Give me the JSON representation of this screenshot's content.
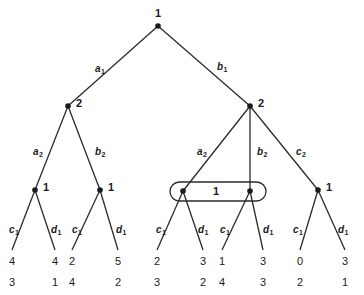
{
  "figure": {
    "background_color": "#ffffff",
    "stroke_color": "#2b2b2b",
    "node_color": "#1a1a1a"
  },
  "nodes": [
    {
      "id": "root",
      "label": "1",
      "x": 158,
      "y": 26,
      "label_dx": 0,
      "label_dy": -13,
      "label_align": "center"
    },
    {
      "id": "n-l2a",
      "label": "2",
      "x": 68,
      "y": 106,
      "label_dx": 8,
      "label_dy": -3,
      "label_align": "left"
    },
    {
      "id": "n-l2b",
      "label": "2",
      "x": 250,
      "y": 106,
      "label_dx": 8,
      "label_dy": -3,
      "label_align": "left"
    },
    {
      "id": "n-l3a",
      "label": "1",
      "x": 35,
      "y": 190,
      "label_dx": 8,
      "label_dy": -3,
      "label_align": "left"
    },
    {
      "id": "n-l3b",
      "label": "1",
      "x": 100,
      "y": 190,
      "label_dx": 8,
      "label_dy": -3,
      "label_align": "left"
    },
    {
      "id": "n-l3c",
      "label": "",
      "x": 183,
      "y": 191,
      "label_dx": 0,
      "label_dy": 0,
      "label_align": "none"
    },
    {
      "id": "n-l3d",
      "label": "",
      "x": 250,
      "y": 191,
      "label_dx": 0,
      "label_dy": 0,
      "label_align": "none"
    },
    {
      "id": "n-l3e",
      "label": "1",
      "x": 318,
      "y": 190,
      "label_dx": 8,
      "label_dy": -3,
      "label_align": "left"
    }
  ],
  "infoset": {
    "id": "infoset-oval",
    "label": "1",
    "label_x": 216,
    "label_y": 192,
    "x": 170,
    "y": 182,
    "width": 96,
    "height": 19
  },
  "edges": [
    {
      "id": "e-root-l",
      "from": "root",
      "to": "n-l2a",
      "label": "a",
      "sub": "1",
      "label_x": 95,
      "label_y": 64
    },
    {
      "id": "e-root-r",
      "from": "root",
      "to": "n-l2b",
      "label": "b",
      "sub": "1",
      "label_x": 217,
      "label_y": 62
    },
    {
      "id": "e-l2a-l",
      "from": "n-l2a",
      "to": "n-l3a",
      "label": "a",
      "sub": "2",
      "label_x": 33,
      "label_y": 147
    },
    {
      "id": "e-l2a-r",
      "from": "n-l2a",
      "to": "n-l3b",
      "label": "b",
      "sub": "2",
      "label_x": 95,
      "label_y": 147
    },
    {
      "id": "e-l2b-a",
      "from": "n-l2b",
      "to": "n-l3c",
      "label": "a",
      "sub": "2",
      "label_x": 197,
      "label_y": 147
    },
    {
      "id": "e-l2b-b",
      "from": "n-l2b",
      "to": "n-l3d",
      "label": "b",
      "sub": "2",
      "label_x": 257,
      "label_y": 147
    },
    {
      "id": "e-l2b-c",
      "from": "n-l2b",
      "to": "n-l3e",
      "label": "c",
      "sub": "2",
      "label_x": 296,
      "label_y": 147
    },
    {
      "id": "e-l3a-c",
      "from": "n-l3a",
      "to": "leaf0",
      "label": "c",
      "sub": "1",
      "label_x": 9,
      "label_y": 225
    },
    {
      "id": "e-l3a-d",
      "from": "n-l3a",
      "to": "leaf1",
      "label": "d",
      "sub": "1",
      "label_x": 51,
      "label_y": 225
    },
    {
      "id": "e-l3b-c",
      "from": "n-l3b",
      "to": "leaf2",
      "label": "c",
      "sub": "1",
      "label_x": 72,
      "label_y": 225
    },
    {
      "id": "e-l3b-d",
      "from": "n-l3b",
      "to": "leaf3",
      "label": "d",
      "sub": "1",
      "label_x": 116,
      "label_y": 225
    },
    {
      "id": "e-l3c-c",
      "from": "n-l3c",
      "to": "leaf4",
      "label": "c",
      "sub": "1",
      "label_x": 156,
      "label_y": 225
    },
    {
      "id": "e-l3c-d",
      "from": "n-l3c",
      "to": "leaf5",
      "label": "d",
      "sub": "1",
      "label_x": 198,
      "label_y": 225
    },
    {
      "id": "e-l3d-c",
      "from": "n-l3d",
      "to": "leaf6",
      "label": "c",
      "sub": "1",
      "label_x": 220,
      "label_y": 225
    },
    {
      "id": "e-l3d-d",
      "from": "n-l3d",
      "to": "leaf7",
      "label": "d",
      "sub": "1",
      "label_x": 263,
      "label_y": 225
    },
    {
      "id": "e-l3e-c",
      "from": "n-l3e",
      "to": "leaf8",
      "label": "c",
      "sub": "1",
      "label_x": 293,
      "label_y": 225
    },
    {
      "id": "e-l3e-d",
      "from": "n-l3e",
      "to": "leaf9",
      "label": "d",
      "sub": "1",
      "label_x": 338,
      "label_y": 225
    }
  ],
  "leaves": [
    {
      "id": "leaf0",
      "x": 12,
      "y": 256,
      "top": "4",
      "bottom": "3"
    },
    {
      "id": "leaf1",
      "x": 55,
      "y": 256,
      "top": "4",
      "bottom": "1"
    },
    {
      "id": "leaf2",
      "x": 72,
      "y": 256,
      "top": "2",
      "bottom": "4"
    },
    {
      "id": "leaf3",
      "x": 118,
      "y": 256,
      "top": "5",
      "bottom": "2"
    },
    {
      "id": "leaf4",
      "x": 157,
      "y": 256,
      "top": "2",
      "bottom": "3"
    },
    {
      "id": "leaf5",
      "x": 203,
      "y": 256,
      "top": "3",
      "bottom": "2"
    },
    {
      "id": "leaf6",
      "x": 222,
      "y": 256,
      "top": "1",
      "bottom": "4"
    },
    {
      "id": "leaf7",
      "x": 263,
      "y": 256,
      "top": "3",
      "bottom": "3"
    },
    {
      "id": "leaf8",
      "x": 300,
      "y": 256,
      "top": "0",
      "bottom": "2"
    },
    {
      "id": "leaf9",
      "x": 345,
      "y": 256,
      "top": "3",
      "bottom": "1"
    }
  ]
}
